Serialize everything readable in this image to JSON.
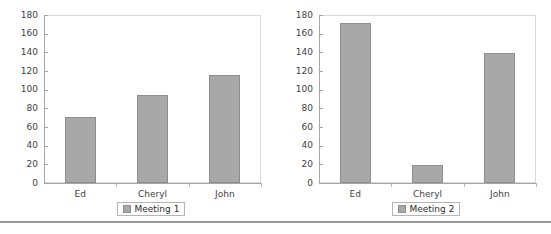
{
  "page": {
    "background_color": "#ffffff",
    "bottom_rule_color": "#9a9a9a"
  },
  "style": {
    "bar_fill": "#a8a8a8",
    "bar_border": "#8e8e8e",
    "axis_color": "#a6a6a6",
    "plot_border": "#d8d8d8",
    "text_color": "#3f3f3f"
  },
  "charts": [
    {
      "id": "chart-1",
      "legend": {
        "label": "Meeting 1",
        "swatch_icon": "legend-swatch-icon",
        "swatch_color": "#a8a8a8"
      },
      "yticks": [
        "180",
        "160",
        "140",
        "120",
        "100",
        "80",
        "60",
        "40",
        "20",
        "0"
      ],
      "xlabels": [
        "Ed",
        "Cheryl",
        "John"
      ]
    },
    {
      "id": "chart-2",
      "legend": {
        "label": "Meeting 2",
        "swatch_icon": "legend-swatch-icon",
        "swatch_color": "#a8a8a8"
      },
      "yticks": [
        "180",
        "160",
        "140",
        "120",
        "100",
        "80",
        "60",
        "40",
        "20",
        "0"
      ],
      "xlabels": [
        "Ed",
        "Cheryl",
        "John"
      ]
    }
  ],
  "chart_data": [
    {
      "type": "bar",
      "title": "",
      "categories": [
        "Ed",
        "Cheryl",
        "John"
      ],
      "series": [
        {
          "name": "Meeting 1",
          "values": [
            71,
            94,
            116
          ]
        }
      ],
      "values": [
        71,
        94,
        116
      ],
      "xlabel": "",
      "ylabel": "",
      "ylim": [
        0,
        180
      ],
      "ytick_step": 20,
      "yticks": [
        0,
        20,
        40,
        60,
        80,
        100,
        120,
        140,
        160,
        180
      ],
      "grid": false,
      "legend": "bottom",
      "legend_entries": [
        "Meeting 1"
      ]
    },
    {
      "type": "bar",
      "title": "",
      "categories": [
        "Ed",
        "Cheryl",
        "John"
      ],
      "series": [
        {
          "name": "Meeting 2",
          "values": [
            171,
            19,
            139
          ]
        }
      ],
      "values": [
        171,
        19,
        139
      ],
      "xlabel": "",
      "ylabel": "",
      "ylim": [
        0,
        180
      ],
      "ytick_step": 20,
      "yticks": [
        0,
        20,
        40,
        60,
        80,
        100,
        120,
        140,
        160,
        180
      ],
      "grid": false,
      "legend": "bottom",
      "legend_entries": [
        "Meeting 2"
      ]
    }
  ]
}
